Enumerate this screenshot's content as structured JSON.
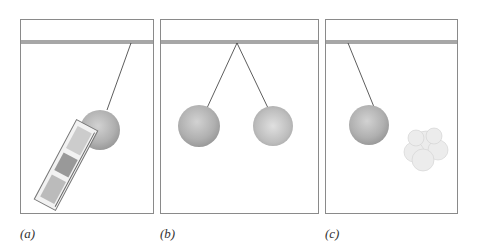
{
  "figure": {
    "panels": [
      {
        "id": "a",
        "label": "(a)",
        "description": "Pendulum ball hanging at an angle, attracted toward a plastic/paper object"
      },
      {
        "id": "b",
        "label": "(b)",
        "description": "Two pendulum balls on strings from one point, repelling each other"
      },
      {
        "id": "c",
        "label": "(c)",
        "description": "Pendulum ball deflected toward a cotton-like fluffy object"
      }
    ],
    "colors": {
      "border": "#8a8a8a",
      "bar": "#a7a7a7",
      "string": "#333333",
      "ball": "#b5b5b5"
    }
  }
}
